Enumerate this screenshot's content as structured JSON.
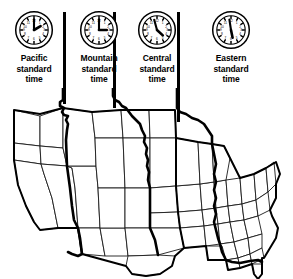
{
  "figure": {
    "type": "time-zone-map"
  },
  "zones": [
    {
      "id": "pacific",
      "name_line1": "Pacific",
      "name_line2": "standard",
      "name_line3": "time",
      "clock_icon": "analog-clock-icon",
      "clock_time": "12:10",
      "hour_hand_deg": 60,
      "minute_hand_deg": 0
    },
    {
      "id": "mountain",
      "name_line1": "Mountain",
      "name_line2": "standard",
      "name_line3": "time",
      "clock_icon": "analog-clock-icon",
      "clock_time": "1:15",
      "hour_hand_deg": 90,
      "minute_hand_deg": 0
    },
    {
      "id": "central",
      "name_line1": "Central",
      "name_line2": "standard",
      "name_line3": "time",
      "clock_icon": "analog-clock-icon",
      "clock_time": "2:20",
      "hour_hand_deg": 130,
      "minute_hand_deg": 345
    },
    {
      "id": "eastern",
      "name_line1": "Eastern",
      "name_line2": "standard",
      "name_line3": "time",
      "clock_icon": "analog-clock-icon",
      "clock_time": "3:30",
      "hour_hand_deg": 170,
      "minute_hand_deg": 350
    }
  ],
  "clock_face": {
    "hour_marks": 12,
    "numerals_visible": true,
    "numerals": [
      "12",
      "1",
      "2",
      "3",
      "4",
      "5",
      "6",
      "7",
      "8",
      "9",
      "10",
      "11"
    ]
  },
  "colors": {
    "ink": "#000000",
    "paper": "#ffffff",
    "state_border": "#1a1a1a",
    "zone_border": "#000000"
  },
  "leader_lines": [
    {
      "id": "pacific-mountain-leader",
      "x": 63,
      "height": 92
    },
    {
      "id": "mountain-central-leader",
      "x": 113,
      "height": 96
    },
    {
      "id": "central-eastern-leader",
      "x": 177,
      "height": 110
    }
  ]
}
